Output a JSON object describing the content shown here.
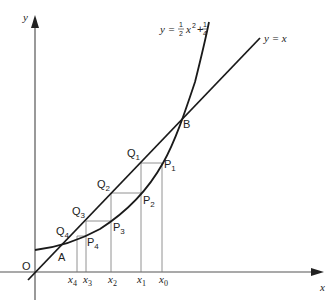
{
  "diagram": {
    "axes": {
      "x_label": "x",
      "y_label": "y",
      "origin_label": "O"
    },
    "curves": [
      {
        "name": "parabola",
        "equation_label": {
          "prefix": "y = ",
          "frac1_num": "1",
          "frac1_den": "2",
          "var": "x",
          "exp": "2",
          "plus": " + ",
          "frac2_num": "1",
          "frac2_den": "4"
        }
      },
      {
        "name": "line",
        "equation_label": "y = x"
      }
    ],
    "intersections": [
      {
        "label": "A"
      },
      {
        "label": "B"
      }
    ],
    "points_P": [
      {
        "base": "P",
        "sub": "1"
      },
      {
        "base": "P",
        "sub": "2"
      },
      {
        "base": "P",
        "sub": "3"
      },
      {
        "base": "P",
        "sub": "4"
      }
    ],
    "points_Q": [
      {
        "base": "Q",
        "sub": "1"
      },
      {
        "base": "Q",
        "sub": "2"
      },
      {
        "base": "Q",
        "sub": "3"
      },
      {
        "base": "Q",
        "sub": "4"
      }
    ],
    "x_ticks": [
      {
        "base": "x",
        "sub": "4"
      },
      {
        "base": "x",
        "sub": "3"
      },
      {
        "base": "x",
        "sub": "2"
      },
      {
        "base": "x",
        "sub": "1"
      },
      {
        "base": "x",
        "sub": "0"
      }
    ]
  }
}
